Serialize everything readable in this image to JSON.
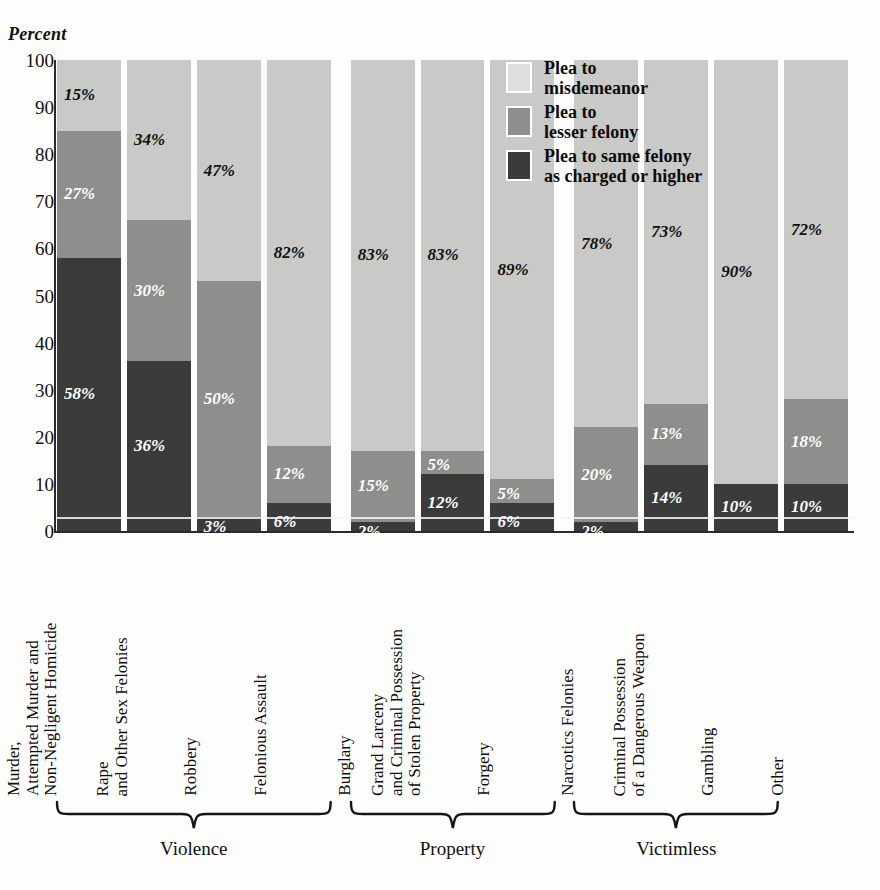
{
  "axis": {
    "ylabel": "Percent",
    "ticks": [
      100,
      90,
      80,
      70,
      60,
      50,
      40,
      30,
      20,
      10,
      0
    ]
  },
  "legend": {
    "items": [
      {
        "key": "mis",
        "line1": "Plea to",
        "line2": "misdemeanor",
        "color": "#dedede"
      },
      {
        "key": "les",
        "line1": "Plea to",
        "line2": "lesser felony",
        "color": "#8e8e8c"
      },
      {
        "key": "same",
        "line1": "Plea to same felony",
        "line2": "as charged or higher",
        "color": "#3b3b3b"
      }
    ]
  },
  "groups": [
    {
      "label": "Violence",
      "first": 0,
      "last": 3
    },
    {
      "label": "Property",
      "first": 4,
      "last": 6
    },
    {
      "label": "Victimless",
      "first": 7,
      "last": 9
    }
  ],
  "chart_data": {
    "type": "bar",
    "title": "Percent",
    "xlabel": "",
    "ylabel": "Percent",
    "ylim": [
      0,
      100
    ],
    "grid": false,
    "stacked": true,
    "legend_position": "inside-top-right",
    "categories": [
      "Murder,\nAttempted Murder and\nNon-Negligent Homicide",
      "Rape\nand Other Sex Felonies",
      "Robbery",
      "Felonious Assault",
      "Burglary",
      "Grand Larceny\nand Criminal Possession\nof Stolen Property",
      "Forgery",
      "Narcotics Felonies",
      "Criminal Possession\nof a Dangerous Weapon",
      "Gambling",
      "Other"
    ],
    "series": [
      {
        "name": "Plea to misdemeanor",
        "color": "#c9c9c7",
        "values": [
          15,
          34,
          47,
          82,
          83,
          83,
          89,
          78,
          73,
          90,
          72
        ]
      },
      {
        "name": "Plea to lesser felony",
        "color": "#8e8e8c",
        "values": [
          27,
          30,
          50,
          12,
          15,
          5,
          5,
          20,
          13,
          0,
          18
        ]
      },
      {
        "name": "Plea to same felony as charged or higher",
        "color": "#3b3b3b",
        "values": [
          58,
          36,
          3,
          6,
          2,
          12,
          6,
          2,
          14,
          10,
          10
        ]
      }
    ]
  },
  "bars": [
    {
      "cat_lines": [
        "Murder,",
        "Attempted Murder and",
        "Non-Negligent Homicide"
      ],
      "mis": 15,
      "les": 27,
      "same": 58,
      "mis_label": "15%",
      "les_label": "27%",
      "same_label": "58%"
    },
    {
      "cat_lines": [
        "Rape",
        "and Other Sex Felonies"
      ],
      "mis": 34,
      "les": 30,
      "same": 36,
      "mis_label": "34%",
      "les_label": "30%",
      "same_label": "36%"
    },
    {
      "cat_lines": [
        "Robbery"
      ],
      "mis": 47,
      "les": 50,
      "same": 3,
      "mis_label": "47%",
      "les_label": "50%",
      "same_label": "3%"
    },
    {
      "cat_lines": [
        "Felonious Assault"
      ],
      "mis": 82,
      "les": 12,
      "same": 6,
      "mis_label": "82%",
      "les_label": "12%",
      "same_label": "6%"
    },
    {
      "cat_lines": [
        "Burglary"
      ],
      "mis": 83,
      "les": 15,
      "same": 2,
      "mis_label": "83%",
      "les_label": "15%",
      "same_label": "2%"
    },
    {
      "cat_lines": [
        "Grand Larceny",
        "and Criminal Possession",
        "of Stolen Property"
      ],
      "mis": 83,
      "les": 5,
      "same": 12,
      "mis_label": "83%",
      "les_label": "5%",
      "same_label": "12%"
    },
    {
      "cat_lines": [
        "Forgery"
      ],
      "mis": 89,
      "les": 5,
      "same": 6,
      "mis_label": "89%",
      "les_label": "5%",
      "same_label": "6%"
    },
    {
      "cat_lines": [
        "Narcotics Felonies"
      ],
      "mis": 78,
      "les": 20,
      "same": 2,
      "mis_label": "78%",
      "les_label": "20%",
      "same_label": "2%"
    },
    {
      "cat_lines": [
        "Criminal Possession",
        "of a Dangerous Weapon"
      ],
      "mis": 73,
      "les": 13,
      "same": 14,
      "mis_label": "73%",
      "les_label": "13%",
      "same_label": "14%"
    },
    {
      "cat_lines": [
        "Gambling"
      ],
      "mis": 90,
      "les": 0,
      "same": 10,
      "mis_label": "90%",
      "les_label": "",
      "same_label": "10%"
    },
    {
      "cat_lines": [
        "Other"
      ],
      "mis": 72,
      "les": 18,
      "same": 10,
      "mis_label": "72%",
      "les_label": "18%",
      "same_label": "10%"
    }
  ]
}
